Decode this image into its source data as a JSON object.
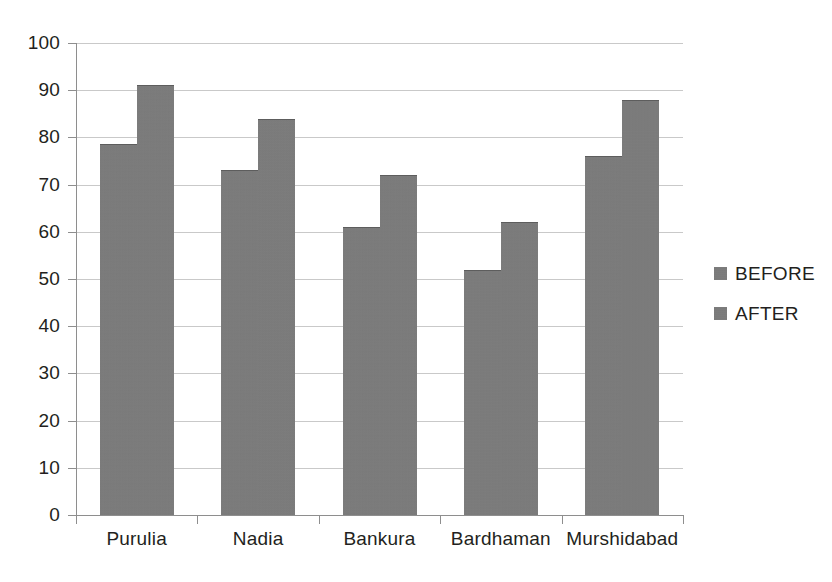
{
  "chart_data": {
    "type": "bar",
    "title": "",
    "subtitle": "",
    "xlabel": "",
    "ylabel": "",
    "categories": [
      "Purulia",
      "Nadia",
      "Bankura",
      "Bardhaman",
      "Murshidabad"
    ],
    "series": [
      {
        "name": "BEFORE",
        "values": [
          78.5,
          73,
          61,
          52,
          76
        ],
        "color": "#7b7b7b"
      },
      {
        "name": "AFTER",
        "values": [
          91,
          84,
          72,
          62,
          88
        ],
        "color": "#7b7b7b"
      }
    ],
    "ylim": [
      0,
      100
    ],
    "yticks": [
      0,
      10,
      20,
      30,
      40,
      50,
      60,
      70,
      80,
      90,
      100
    ],
    "ytick_labels": [
      "0",
      "10",
      "20",
      "30",
      "40",
      "50",
      "60",
      "70",
      "80",
      "90",
      "100"
    ],
    "grid": true,
    "grid_axis": "y",
    "legend": [
      "BEFORE",
      "AFTER"
    ],
    "legend_position": "right",
    "bar_gap_within_group": 0,
    "annotations": []
  },
  "legend": {
    "items": [
      {
        "label": "BEFORE",
        "swatch_name": "legend-swatch-before"
      },
      {
        "label": "AFTER",
        "swatch_name": "legend-swatch-after"
      }
    ]
  },
  "colors": {
    "bar_fill": "#7b7b7b",
    "bar_edge": "#5d5d5d",
    "gridline": "#c9c9c9",
    "axis": "#8e8e8e",
    "text": "#231f20",
    "background": "#ffffff"
  }
}
